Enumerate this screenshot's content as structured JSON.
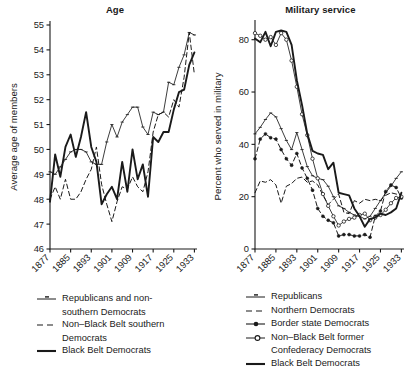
{
  "figure": {
    "background": "#ffffff",
    "ink": "#1a1a1a"
  },
  "panels": [
    {
      "id": "age",
      "title": "Age",
      "ylabel": "Average age of members"
    },
    {
      "id": "military",
      "title": "Military service",
      "ylabel": "Percent who served in military"
    }
  ],
  "legend_left": {
    "items": [
      {
        "key": "line-marker-thin",
        "label": "Republicans and non-",
        "label2": "southern Democrats"
      },
      {
        "key": "line-dashed",
        "label": "Non–Black Belt southern",
        "label2": "Democrats"
      },
      {
        "key": "line-solid-thick",
        "label": "Black Belt Democrats",
        "label2": ""
      }
    ]
  },
  "legend_right": {
    "items": [
      {
        "key": "line-marker-thin",
        "label": "Republicans",
        "label2": ""
      },
      {
        "key": "line-dashed",
        "label": "Northern Democrats",
        "label2": ""
      },
      {
        "key": "line-dot-filled",
        "label": "Border state Democrats",
        "label2": ""
      },
      {
        "key": "line-circle-open",
        "label": "Non–Black Belt former",
        "label2": "Confederacy Democrats"
      },
      {
        "key": "line-solid-thick",
        "label": "Black Belt Democrats",
        "label2": ""
      }
    ]
  },
  "chart_data": [
    {
      "type": "line",
      "id": "age",
      "title": "Age",
      "xlabel": "",
      "ylabel": "Average age of members",
      "xlim": [
        1877,
        1934
      ],
      "ylim": [
        46,
        55
      ],
      "xticks": [
        1877,
        1885,
        1893,
        1901,
        1909,
        1917,
        1925,
        1933
      ],
      "xticklabels": [
        "1877",
        "1885",
        "1893",
        "1901",
        "1909",
        "1917",
        "1925",
        "1933"
      ],
      "yticks": [
        46,
        47,
        48,
        49,
        50,
        51,
        52,
        53,
        54,
        55
      ],
      "yticklabels": [
        "46",
        "47",
        "48",
        "49",
        "50",
        "51",
        "52",
        "53",
        "54",
        "55"
      ],
      "grid": false,
      "legend_position": "below",
      "x": [
        1877,
        1879,
        1881,
        1883,
        1885,
        1887,
        1889,
        1891,
        1893,
        1895,
        1897,
        1899,
        1901,
        1903,
        1905,
        1907,
        1909,
        1911,
        1913,
        1915,
        1917,
        1919,
        1921,
        1923,
        1925,
        1927,
        1929,
        1931,
        1933
      ],
      "series": [
        {
          "name": "Republicans and non-southern Democrats",
          "style": "thin-line-with-markers",
          "values": [
            49.1,
            49.0,
            49.3,
            49.6,
            49.9,
            50.0,
            50.0,
            49.9,
            49.5,
            49.4,
            49.4,
            50.3,
            51.0,
            50.5,
            51.1,
            51.4,
            51.7,
            51.7,
            50.9,
            50.6,
            51.5,
            51.4,
            51.5,
            52.7,
            52.6,
            53.3,
            53.8,
            54.7,
            54.6
          ]
        },
        {
          "name": "Non–Black Belt southern Democrats",
          "style": "dashed",
          "values": [
            48.0,
            48.5,
            48.0,
            48.8,
            48.0,
            48.0,
            48.3,
            48.8,
            49.2,
            50.1,
            48.6,
            47.8,
            47.1,
            47.9,
            48.5,
            48.4,
            48.9,
            48.5,
            48.3,
            49.1,
            50.7,
            51.4,
            51.5,
            51.3,
            52.0,
            51.7,
            52.9,
            54.7,
            53.0
          ]
        },
        {
          "name": "Black Belt Democrats",
          "style": "solid-thick",
          "values": [
            47.9,
            49.8,
            48.9,
            50.1,
            50.6,
            49.7,
            50.5,
            51.5,
            50.1,
            49.5,
            47.8,
            48.2,
            48.5,
            48.0,
            49.5,
            48.3,
            50.0,
            48.8,
            49.4,
            48.1,
            50.5,
            50.3,
            50.7,
            50.7,
            51.6,
            52.3,
            52.4,
            53.4,
            53.9
          ]
        }
      ]
    },
    {
      "type": "line",
      "id": "military",
      "title": "Military service",
      "xlabel": "",
      "ylabel": "Percent who served in military",
      "xlim": [
        1877,
        1934
      ],
      "ylim": [
        0,
        86
      ],
      "xticks": [
        1877,
        1885,
        1893,
        1901,
        1909,
        1917,
        1925,
        1933
      ],
      "xticklabels": [
        "1877",
        "1885",
        "1893",
        "1901",
        "1909",
        "1917",
        "1925",
        "1933"
      ],
      "yticks": [
        0,
        20,
        40,
        60,
        80
      ],
      "yticklabels": [
        "0",
        "20",
        "40",
        "60",
        "80"
      ],
      "grid": false,
      "legend_position": "below",
      "x": [
        1877,
        1879,
        1881,
        1883,
        1885,
        1887,
        1889,
        1891,
        1893,
        1895,
        1897,
        1899,
        1901,
        1903,
        1905,
        1907,
        1909,
        1911,
        1913,
        1915,
        1917,
        1919,
        1921,
        1923,
        1925,
        1927,
        1929,
        1931,
        1933
      ],
      "series": [
        {
          "name": "Republicans",
          "style": "thin-line-with-markers",
          "values": [
            44.0,
            46.5,
            49.5,
            52.0,
            50.5,
            46.0,
            41.5,
            38.0,
            44.5,
            38.0,
            31.5,
            28.0,
            27.0,
            26.5,
            24.0,
            20.0,
            16.5,
            15.5,
            14.0,
            13.0,
            12.5,
            11.5,
            12.5,
            15.5,
            18.5,
            21.5,
            24.0,
            27.0,
            29.5
          ]
        },
        {
          "name": "Northern Democrats",
          "style": "dashed",
          "values": [
            21.5,
            26.0,
            25.5,
            26.5,
            24.5,
            17.5,
            24.0,
            25.0,
            27.0,
            27.5,
            25.5,
            26.0,
            24.5,
            20.5,
            17.0,
            19.0,
            21.0,
            14.0,
            13.5,
            18.5,
            17.5,
            19.0,
            18.5,
            19.0,
            18.5,
            20.5,
            21.5,
            21.0,
            20.5
          ]
        },
        {
          "name": "Border state Democrats",
          "style": "dashed-filled-dot",
          "values": [
            34.5,
            42.0,
            44.0,
            42.5,
            42.0,
            38.0,
            34.5,
            32.0,
            36.5,
            31.0,
            27.0,
            22.5,
            15.5,
            12.5,
            11.0,
            10.0,
            5.0,
            5.5,
            5.5,
            5.0,
            5.0,
            5.5,
            4.5,
            12.5,
            14.5,
            22.0,
            24.5,
            23.5,
            19.5
          ]
        },
        {
          "name": "Non–Black Belt former Confederacy Democrats",
          "style": "thin-line-open-circle",
          "values": [
            82.5,
            81.5,
            80.0,
            81.0,
            78.0,
            82.5,
            80.0,
            72.0,
            62.0,
            51.5,
            43.5,
            34.5,
            27.0,
            21.0,
            16.5,
            12.5,
            9.0,
            10.5,
            11.5,
            12.0,
            13.0,
            13.5,
            11.0,
            12.0,
            13.0,
            15.0,
            17.5,
            19.5,
            20.0
          ]
        },
        {
          "name": "Black Belt Democrats",
          "style": "solid-thick",
          "values": [
            80.5,
            79.0,
            83.0,
            77.5,
            83.0,
            83.5,
            83.0,
            78.0,
            64.5,
            55.0,
            44.0,
            37.5,
            36.5,
            36.0,
            30.5,
            33.0,
            21.5,
            21.0,
            20.5,
            15.5,
            12.5,
            8.5,
            11.5,
            12.0,
            13.5,
            13.0,
            14.0,
            15.5,
            21.5
          ]
        }
      ]
    }
  ]
}
